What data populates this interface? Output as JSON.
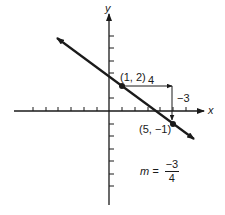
{
  "diagram": {
    "axes": {
      "x_label": "x",
      "y_label": "y",
      "x_ticks": [
        -7,
        -6,
        -5,
        -4,
        -3,
        -2,
        -1,
        1,
        2,
        3,
        4,
        5,
        6,
        7
      ],
      "y_ticks": [
        -6,
        -5,
        -4,
        -3,
        -2,
        -1,
        1,
        2,
        3,
        4,
        5,
        6
      ]
    },
    "points": [
      {
        "label": "(1, 2)",
        "x": 1,
        "y": 2
      },
      {
        "label": "(5, −1)",
        "x": 5,
        "y": -1
      }
    ],
    "run": {
      "label": "4",
      "value": 4
    },
    "rise": {
      "label": "−3",
      "value": -3
    },
    "slope": {
      "prefix": "m =",
      "numerator": "−3",
      "denominator": "4"
    },
    "colors": {
      "ink": "#1a1a1a",
      "background": "#ffffff"
    }
  }
}
